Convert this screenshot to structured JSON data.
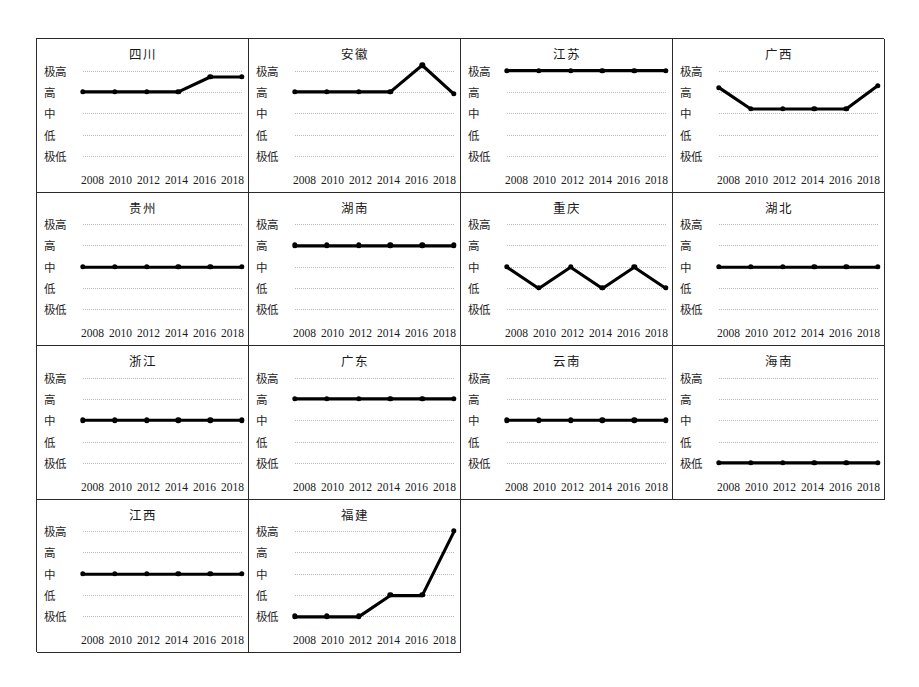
{
  "figure": {
    "axis_levels": [
      "极高",
      "高",
      "中",
      "低",
      "极低"
    ],
    "years": [
      "2008",
      "2010",
      "2012",
      "2014",
      "2016",
      "2018"
    ],
    "line_color": "#000000",
    "grid_color": "#b9b9c4",
    "frame_color": "#2a2a2a"
  },
  "chart_data": {
    "type": "line",
    "title": "",
    "xlabel": "",
    "ylabel": "",
    "x": [
      "2008",
      "2010",
      "2012",
      "2014",
      "2016",
      "2018"
    ],
    "ytick_labels": [
      "极低",
      "低",
      "中",
      "高",
      "极高"
    ],
    "ylim": [
      -0.45,
      4.45
    ],
    "grid": true,
    "legend": "none",
    "panel_layout": {
      "rows": 4,
      "cols": 4,
      "panels_used": 14
    },
    "level_scale": {
      "极低": 0,
      "低": 1,
      "中": 2,
      "高": 3,
      "极高": 4
    },
    "panels": [
      {
        "name": "四川",
        "values": [
          3.0,
          3.0,
          3.0,
          3.0,
          3.7,
          3.7
        ],
        "levels": [
          "高",
          "高",
          "高",
          "高",
          "高/极高之间",
          "高/极高之间"
        ]
      },
      {
        "name": "安徽",
        "values": [
          3.0,
          3.0,
          3.0,
          3.0,
          4.25,
          2.9
        ],
        "levels": [
          "高",
          "高",
          "高",
          "高",
          "极高以上",
          "高"
        ]
      },
      {
        "name": "江苏",
        "values": [
          4.0,
          4.0,
          4.0,
          4.0,
          4.0,
          4.0
        ],
        "levels": [
          "极高",
          "极高",
          "极高",
          "极高",
          "极高",
          "极高"
        ]
      },
      {
        "name": "广西",
        "values": [
          3.2,
          2.2,
          2.2,
          2.2,
          2.2,
          3.3
        ],
        "levels": [
          "高",
          "中",
          "中",
          "中",
          "中",
          "高"
        ]
      },
      {
        "name": "贵州",
        "values": [
          2.0,
          2.0,
          2.0,
          2.0,
          2.0,
          2.0
        ],
        "levels": [
          "中",
          "中",
          "中",
          "中",
          "中",
          "中"
        ]
      },
      {
        "name": "湖南",
        "values": [
          3.0,
          3.0,
          3.0,
          3.0,
          3.0,
          3.0
        ],
        "levels": [
          "高",
          "高",
          "高",
          "高",
          "高",
          "高"
        ]
      },
      {
        "name": "重庆",
        "values": [
          2.0,
          1.0,
          2.0,
          1.0,
          2.0,
          1.0
        ],
        "levels": [
          "中",
          "低",
          "中",
          "低",
          "中",
          "低"
        ]
      },
      {
        "name": "湖北",
        "values": [
          2.0,
          2.0,
          2.0,
          2.0,
          2.0,
          2.0
        ],
        "levels": [
          "中",
          "中",
          "中",
          "中",
          "中",
          "中"
        ]
      },
      {
        "name": "浙江",
        "values": [
          2.0,
          2.0,
          2.0,
          2.0,
          2.0,
          2.0
        ],
        "levels": [
          "中",
          "中",
          "中",
          "中",
          "中",
          "中"
        ]
      },
      {
        "name": "广东",
        "values": [
          3.0,
          3.0,
          3.0,
          3.0,
          3.0,
          3.0
        ],
        "levels": [
          "高",
          "高",
          "高",
          "高",
          "高",
          "高"
        ]
      },
      {
        "name": "云南",
        "values": [
          2.0,
          2.0,
          2.0,
          2.0,
          2.0,
          2.0
        ],
        "levels": [
          "中",
          "中",
          "中",
          "中",
          "中",
          "中"
        ]
      },
      {
        "name": "海南",
        "values": [
          0.0,
          0.0,
          0.0,
          0.0,
          0.0,
          0.0
        ],
        "levels": [
          "极低",
          "极低",
          "极低",
          "极低",
          "极低",
          "极低"
        ]
      },
      {
        "name": "江西",
        "values": [
          2.0,
          2.0,
          2.0,
          2.0,
          2.0,
          2.0
        ],
        "levels": [
          "中",
          "中",
          "中",
          "中",
          "中",
          "中"
        ]
      },
      {
        "name": "福建",
        "values": [
          0.0,
          0.0,
          0.0,
          1.0,
          1.0,
          4.0
        ],
        "levels": [
          "极低",
          "极低",
          "极低",
          "低",
          "低",
          "极高"
        ]
      }
    ]
  }
}
